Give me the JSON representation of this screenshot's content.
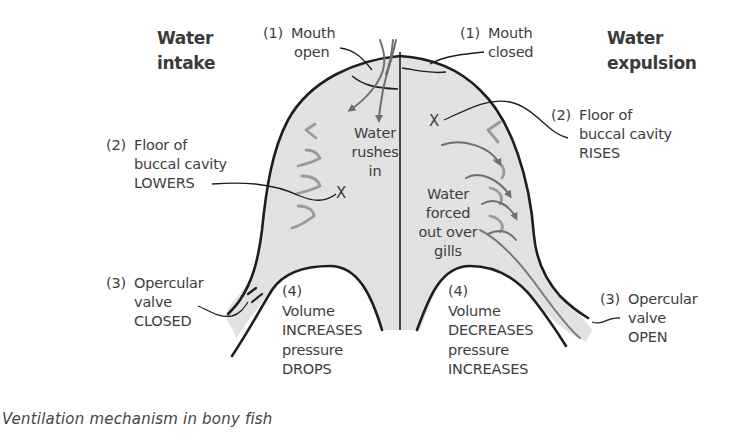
{
  "diagram": {
    "title": "Ventilation mechanism in bony fish",
    "colors": {
      "cavity_fill": "#e3e3e3",
      "outline": "#1e1e1e",
      "arrow": "#6f6f6f",
      "gill": "#9a9a9a",
      "text": "#3d3d3d"
    },
    "left_panel": {
      "heading_line1": "Water",
      "heading_line2": "intake",
      "mouth": {
        "num": "(1)",
        "line1": "Mouth",
        "line2": "open"
      },
      "floor": {
        "num": "(2)",
        "line1": "Floor of",
        "line2": "buccal cavity",
        "line3": "LOWERS"
      },
      "valve": {
        "num": "(3)",
        "line1": "Opercular",
        "line2": "valve",
        "line3": "CLOSED"
      },
      "volume": {
        "num": "(4)",
        "line1": "Volume",
        "line2": "INCREASES",
        "line3": "pressure",
        "line4": "DROPS"
      },
      "water_text": {
        "line1": "Water",
        "line2": "rushes",
        "line3": "in"
      },
      "x_mark": "X"
    },
    "right_panel": {
      "heading_line1": "Water",
      "heading_line2": "expulsion",
      "mouth": {
        "num": "(1)",
        "line1": "Mouth",
        "line2": "closed"
      },
      "floor": {
        "num": "(2)",
        "line1": "Floor of",
        "line2": "buccal cavity",
        "line3": "RISES"
      },
      "valve": {
        "num": "(3)",
        "line1": "Opercular",
        "line2": "valve",
        "line3": "OPEN"
      },
      "volume": {
        "num": "(4)",
        "line1": "Volume",
        "line2": "DECREASES",
        "line3": "pressure",
        "line4": "INCREASES"
      },
      "water_text": {
        "line1": "Water",
        "line2": "forced",
        "line3": "out over",
        "line4": "gills"
      },
      "x_mark": "X"
    }
  }
}
